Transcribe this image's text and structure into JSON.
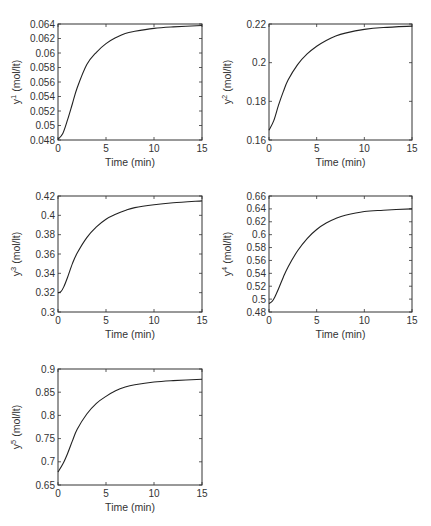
{
  "chart_data": [
    {
      "type": "line",
      "title": "",
      "xlabel": "Time (min)",
      "ylabel": "y1 (mol/lt)",
      "ylabel_base": "y",
      "ylabel_sup": "1",
      "ylabel_unit": " (mol/lt)",
      "xlim": [
        0,
        15
      ],
      "ylim": [
        0.048,
        0.064
      ],
      "xticks": [
        "0",
        "5",
        "10",
        "15"
      ],
      "yticks": [
        "0.048",
        "0.05",
        "0.052",
        "0.054",
        "0.056",
        "0.058",
        "0.06",
        "0.062",
        "0.064"
      ],
      "grid": false,
      "box": {
        "left": 58,
        "top": 24,
        "right": 202,
        "bottom": 140
      },
      "x": [
        0,
        0.5,
        1,
        1.5,
        2,
        3,
        4,
        5,
        6,
        7,
        8,
        10,
        12,
        15
      ],
      "series": [
        {
          "name": "y1",
          "values": [
            0.0481,
            0.0489,
            0.0508,
            0.053,
            0.0552,
            0.0584,
            0.0601,
            0.0613,
            0.0621,
            0.0627,
            0.063,
            0.0634,
            0.0636,
            0.0638
          ]
        }
      ]
    },
    {
      "type": "line",
      "title": "",
      "xlabel": "Time (min)",
      "ylabel": "y2 (mol/lt)",
      "ylabel_base": "y",
      "ylabel_sup": "2",
      "ylabel_unit": " (mol/lt)",
      "xlim": [
        0,
        15
      ],
      "ylim": [
        0.16,
        0.22
      ],
      "xticks": [
        "0",
        "5",
        "10",
        "15"
      ],
      "yticks": [
        "0.16",
        "0.18",
        "0.2",
        "0.22"
      ],
      "grid": false,
      "box": {
        "left": 269,
        "top": 24,
        "right": 412,
        "bottom": 140
      },
      "x": [
        0,
        0.5,
        1,
        1.5,
        2,
        3,
        4,
        5,
        6,
        7,
        8,
        10,
        12,
        15
      ],
      "series": [
        {
          "name": "y2",
          "values": [
            0.165,
            0.17,
            0.178,
            0.185,
            0.191,
            0.199,
            0.2045,
            0.2085,
            0.2115,
            0.2138,
            0.2153,
            0.2172,
            0.2182,
            0.2189
          ]
        }
      ]
    },
    {
      "type": "line",
      "title": "",
      "xlabel": "Time (min)",
      "ylabel": "y3 (mol/lt)",
      "ylabel_base": "y",
      "ylabel_sup": "3",
      "ylabel_unit": " (mol/lt)",
      "xlim": [
        0,
        15
      ],
      "ylim": [
        0.3,
        0.42
      ],
      "xticks": [
        "0",
        "5",
        "10",
        "15"
      ],
      "yticks": [
        "0.3",
        "0.32",
        "0.34",
        "0.36",
        "0.38",
        "0.4",
        "0.42"
      ],
      "grid": false,
      "box": {
        "left": 58,
        "top": 196,
        "right": 202,
        "bottom": 312
      },
      "x": [
        0,
        0.3,
        0.6,
        1,
        1.5,
        2,
        3,
        4,
        5,
        6,
        7,
        8,
        10,
        12,
        15
      ],
      "series": [
        {
          "name": "y3",
          "values": [
            0.32,
            0.321,
            0.326,
            0.336,
            0.35,
            0.361,
            0.377,
            0.388,
            0.396,
            0.401,
            0.405,
            0.408,
            0.411,
            0.413,
            0.415
          ]
        }
      ]
    },
    {
      "type": "line",
      "title": "",
      "xlabel": "Time (min)",
      "ylabel": "y4 (mol/lt)",
      "ylabel_base": "y",
      "ylabel_sup": "4",
      "ylabel_unit": " (mol/lt)",
      "xlim": [
        0,
        15
      ],
      "ylim": [
        0.48,
        0.66
      ],
      "xticks": [
        "0",
        "5",
        "10",
        "15"
      ],
      "yticks": [
        "0.48",
        "0.5",
        "0.52",
        "0.54",
        "0.56",
        "0.58",
        "0.6",
        "0.62",
        "0.64",
        "0.66"
      ],
      "grid": false,
      "box": {
        "left": 269,
        "top": 196,
        "right": 412,
        "bottom": 312
      },
      "x": [
        0,
        0.3,
        0.6,
        1,
        1.5,
        2,
        3,
        4,
        5,
        6,
        7,
        8,
        10,
        12,
        15
      ],
      "series": [
        {
          "name": "y4",
          "values": [
            0.493,
            0.496,
            0.503,
            0.516,
            0.534,
            0.55,
            0.575,
            0.594,
            0.608,
            0.618,
            0.625,
            0.63,
            0.636,
            0.638,
            0.64
          ]
        }
      ]
    },
    {
      "type": "line",
      "title": "",
      "xlabel": "Time (min)",
      "ylabel": "y5 (mol/lt)",
      "ylabel_base": "y",
      "ylabel_sup": "5",
      "ylabel_unit": " (mol/lt)",
      "xlim": [
        0,
        15
      ],
      "ylim": [
        0.65,
        0.9
      ],
      "xticks": [
        "0",
        "5",
        "10",
        "15"
      ],
      "yticks": [
        "0.65",
        "0.7",
        "0.75",
        "0.8",
        "0.85",
        "0.9"
      ],
      "grid": false,
      "box": {
        "left": 58,
        "top": 369,
        "right": 202,
        "bottom": 485
      },
      "x": [
        0,
        0.5,
        1,
        1.5,
        2,
        3,
        4,
        5,
        6,
        7,
        8,
        10,
        12,
        15
      ],
      "series": [
        {
          "name": "y5",
          "values": [
            0.678,
            0.695,
            0.718,
            0.745,
            0.77,
            0.803,
            0.826,
            0.841,
            0.853,
            0.861,
            0.866,
            0.872,
            0.875,
            0.878
          ]
        }
      ]
    }
  ]
}
